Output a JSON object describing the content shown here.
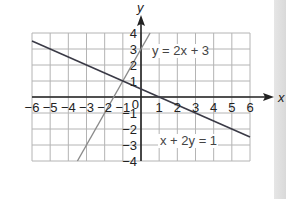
{
  "chart_data": {
    "type": "line",
    "title": "",
    "xlabel": "x",
    "ylabel": "y",
    "xlim": [
      -6,
      6
    ],
    "ylim": [
      -4,
      4
    ],
    "grid": true,
    "x_ticks": [
      "-6",
      "-5",
      "-4",
      "-3",
      "-2",
      "-1",
      "1",
      "2",
      "3",
      "4",
      "5",
      "6"
    ],
    "y_ticks": [
      "4",
      "3",
      "2",
      "1",
      "-1",
      "-2",
      "-3",
      "-4"
    ],
    "origin_label": "0",
    "series": [
      {
        "name": "y = 2x + 3",
        "label": "y = 2x + 3",
        "color": "#8a8a8a",
        "x": [
          -3.5,
          0.5
        ],
        "y": [
          -4,
          4
        ]
      },
      {
        "name": "x + 2y = 1",
        "label": "x + 2y = 1",
        "color": "#3a3a46",
        "x": [
          -6,
          6
        ],
        "y": [
          3.5,
          -2.5
        ]
      }
    ],
    "intersection": {
      "x": -1,
      "y": 1
    }
  },
  "colors": {
    "grid": "#b4b4b4",
    "axis": "#222222",
    "sidebar": "#dedede"
  }
}
